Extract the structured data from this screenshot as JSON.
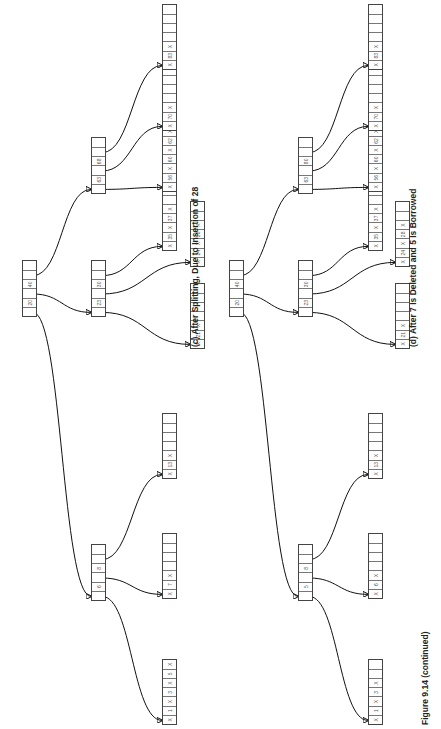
{
  "figure_label": "Figure 9.14 (continued)",
  "trees": [
    {
      "id": "c",
      "caption": "(c) After Splitting, Due to Insertion of 28",
      "root": {
        "cells": [
          "",
          "20",
          "",
          "40",
          "",
          ""
        ]
      },
      "internal": [
        {
          "cells": [
            "",
            "6",
            "",
            "8",
            "",
            ""
          ]
        },
        {
          "cells": [
            "",
            "23",
            "",
            "30",
            "",
            ""
          ]
        },
        {
          "cells": [
            "",
            "63",
            "",
            "68",
            "",
            ""
          ]
        }
      ],
      "leaves": [
        {
          "cells": [
            "X",
            "1",
            "X",
            "3",
            "X",
            "5",
            "X"
          ]
        },
        {
          "cells": [
            "X",
            "7",
            "X",
            "",
            "",
            "",
            ""
          ]
        },
        {
          "cells": [
            "X",
            "13",
            "X",
            "",
            "",
            "",
            ""
          ]
        },
        {
          "cells": [
            "X",
            "21",
            "X",
            "",
            "",
            "",
            ""
          ]
        },
        {
          "cells": [
            "X",
            "24",
            "X",
            "28",
            "X",
            "",
            ""
          ]
        },
        {
          "cells": [
            "X",
            "35",
            "X",
            "37",
            "X",
            "",
            ""
          ]
        },
        {
          "cells": [
            "X",
            "56",
            "X",
            "60",
            "X",
            "62",
            "X"
          ]
        },
        {
          "cells": [
            "X",
            "70",
            "X",
            "",
            "",
            "",
            ""
          ]
        },
        {
          "cells": [
            "X",
            "83",
            "X",
            "",
            "",
            "",
            ""
          ]
        }
      ]
    },
    {
      "id": "d",
      "caption": "(d) After 7 Is Deleted and 5 Is Borrowed",
      "root": {
        "cells": [
          "",
          "20",
          "",
          "40",
          "",
          ""
        ]
      },
      "internal": [
        {
          "cells": [
            "",
            "5",
            "",
            "8",
            "",
            ""
          ]
        },
        {
          "cells": [
            "",
            "23",
            "",
            "30",
            "",
            ""
          ]
        },
        {
          "cells": [
            "",
            "63",
            "",
            "80",
            "",
            ""
          ]
        }
      ],
      "leaves": [
        {
          "cells": [
            "X",
            "1",
            "X",
            "3",
            "X",
            "",
            ""
          ]
        },
        {
          "cells": [
            "X",
            "6",
            "X",
            "",
            "",
            "",
            ""
          ]
        },
        {
          "cells": [
            "X",
            "13",
            "X",
            "",
            "",
            "",
            ""
          ]
        },
        {
          "cells": [
            "X",
            "21",
            "X",
            "",
            "",
            "",
            ""
          ]
        },
        {
          "cells": [
            "X",
            "24",
            "X",
            "28",
            "X",
            "",
            ""
          ]
        },
        {
          "cells": [
            "X",
            "35",
            "X",
            "37",
            "X",
            "",
            ""
          ]
        },
        {
          "cells": [
            "X",
            "56",
            "X",
            "60",
            "X",
            "62",
            "X"
          ]
        },
        {
          "cells": [
            "X",
            "70",
            "X",
            "",
            "",
            "",
            ""
          ]
        },
        {
          "cells": [
            "X",
            "83",
            "X",
            "",
            "",
            "",
            ""
          ]
        }
      ]
    }
  ]
}
